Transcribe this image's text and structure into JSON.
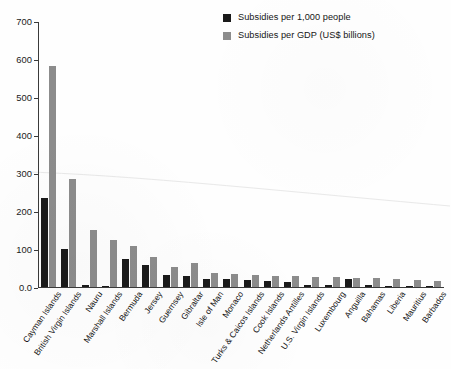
{
  "chart_data": {
    "type": "bar",
    "title": "",
    "subtitle": "",
    "xlabel": "",
    "ylabel": "",
    "ylim": [
      0,
      700
    ],
    "yticks": [
      "0.0",
      "100",
      "200",
      "300",
      "400",
      "500",
      "600",
      "700"
    ],
    "ytick_values": [
      0,
      100,
      200,
      300,
      400,
      500,
      600,
      700
    ],
    "grid": false,
    "legend_position": "top-right",
    "categories": [
      "Cayman Islands",
      "British Virgin Islands",
      "Nauru",
      "Marshall Islands",
      "Bermuda",
      "Jersey",
      "Guernsey",
      "Gibraltar",
      "Isle of Man",
      "Monaco",
      "Turks & Caicos Islands",
      "Cook Islands",
      "Netherlands Antilles",
      "U.S. Virgin Islands",
      "Luxembourg",
      "Anguilla",
      "Bahamas",
      "Liberia",
      "Mauritius",
      "Barbados"
    ],
    "series": [
      {
        "name": "Subsidies per 1,000 people",
        "color": "#1a1a1a",
        "values": [
          235,
          100,
          5,
          3,
          75,
          58,
          32,
          28,
          22,
          20,
          18,
          16,
          14,
          6,
          5,
          22,
          5,
          4,
          4,
          4
        ]
      },
      {
        "name": "Subsidies per GDP (US$ billions)",
        "color": "#8c8c8c",
        "values": [
          583,
          285,
          150,
          123,
          108,
          80,
          52,
          63,
          36,
          35,
          33,
          30,
          28,
          27,
          26,
          25,
          24,
          20,
          18,
          15
        ]
      }
    ]
  },
  "legend": {
    "items": [
      {
        "label": "Subsidies per 1,000 people",
        "color": "#1a1a1a"
      },
      {
        "label": "Subsidies per GDP (US$ billions)",
        "color": "#8c8c8c"
      }
    ]
  }
}
